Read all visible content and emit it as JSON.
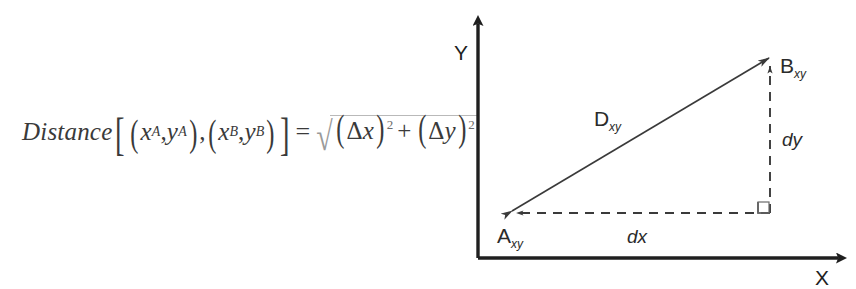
{
  "page": {
    "background_color": "#ffffff",
    "ink_color": "#2b2b2b",
    "width": 856,
    "height": 289
  },
  "formula": {
    "function_name": "Distance",
    "bracket_open": "[",
    "bracket_close": "]",
    "paren_open": "(",
    "paren_close": ")",
    "comma": ",",
    "point_a": {
      "x": "x",
      "x_sub": "A",
      "y": "y",
      "y_sub": "A"
    },
    "point_b": {
      "x": "x",
      "x_sub": "B",
      "y": "y",
      "y_sub": "B"
    },
    "equals": "=",
    "radical_sign": "√",
    "delta": "Δ",
    "term1": {
      "delta": "Δ",
      "var": "x",
      "exponent": "2"
    },
    "plus": "+",
    "term2": {
      "delta": "Δ",
      "var": "y",
      "exponent": "2"
    },
    "plain_text": "Distance[(xA,yA),(xB,yB)] = √((Δx)² + (Δy)²)"
  },
  "diagram": {
    "axes": {
      "y_label": "Y",
      "x_label": "X",
      "origin": {
        "x": 38,
        "y": 258
      },
      "y_axis_top": {
        "x": 38,
        "y": 18
      },
      "x_axis_right": {
        "x": 406,
        "y": 258
      }
    },
    "points": [
      {
        "name": "A",
        "label": "A",
        "subscript": "xy",
        "cx": 72,
        "cy": 213
      },
      {
        "name": "B",
        "label": "B",
        "subscript": "xy",
        "cx": 330,
        "cy": 57
      }
    ],
    "distance_line": {
      "label": "D",
      "subscript": "xy",
      "from": {
        "x": 72,
        "y": 213
      },
      "to": {
        "x": 330,
        "y": 57
      },
      "style": "solid double-headed arrow"
    },
    "legs": [
      {
        "name": "dx",
        "label": "dx",
        "orientation": "horizontal",
        "style": "dashed",
        "from": {
          "x": 330,
          "y": 213
        },
        "to": {
          "x": 72,
          "y": 213
        }
      },
      {
        "name": "dy",
        "label": "dy",
        "orientation": "vertical",
        "style": "dashed",
        "from": {
          "x": 330,
          "y": 213
        },
        "to": {
          "x": 330,
          "y": 62
        }
      }
    ],
    "right_angle_marker": {
      "label": "right-angle",
      "x": 318,
      "y": 201,
      "size": 11
    }
  }
}
